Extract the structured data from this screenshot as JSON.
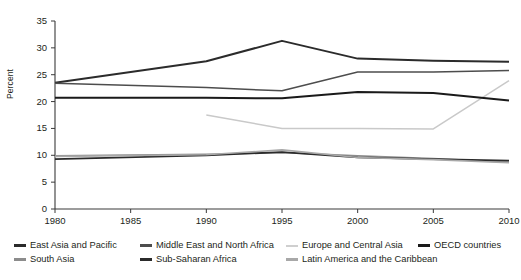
{
  "chart_data": {
    "type": "line",
    "title": "",
    "xlabel": "",
    "ylabel": "Percent",
    "x": [
      1980,
      1985,
      1990,
      1995,
      2000,
      2005,
      2010
    ],
    "xticks": [
      "1980",
      "1985",
      "1990",
      "1995",
      "2000",
      "2005",
      "2010"
    ],
    "yticks": [
      "0",
      "5",
      "10",
      "15",
      "20",
      "25",
      "30",
      "35"
    ],
    "xlim": [
      1980,
      2010
    ],
    "ylim": [
      0,
      35
    ],
    "grid": false,
    "legend_position": "bottom",
    "series": [
      {
        "name": "East Asia and Pacific",
        "color": "#2b2b2b",
        "width": 2.0,
        "x": [
          1980,
          1990,
          1995,
          2000,
          2005,
          2010
        ],
        "values": [
          23.5,
          27.5,
          31.3,
          28.0,
          27.6,
          27.4
        ]
      },
      {
        "name": "Middle East and North Africa",
        "color": "#4d4d4d",
        "width": 1.5,
        "x": [
          1980,
          1990,
          1995,
          2000,
          2005,
          2010
        ],
        "values": [
          23.4,
          22.6,
          22.0,
          25.5,
          25.5,
          25.8
        ]
      },
      {
        "name": "Europe and Central Asia",
        "color": "#c9c9c9",
        "width": 1.5,
        "x": [
          1990,
          1995,
          2000,
          2005,
          2010
        ],
        "values": [
          17.5,
          15.0,
          15.0,
          14.9,
          23.9
        ]
      },
      {
        "name": "OECD countries",
        "color": "#1a1a1a",
        "width": 2.0,
        "x": [
          1980,
          1990,
          1995,
          2000,
          2005,
          2010
        ],
        "values": [
          20.7,
          20.7,
          20.6,
          21.8,
          21.6,
          20.2
        ]
      },
      {
        "name": "South Asia",
        "color": "#8c8c8c",
        "width": 1.5,
        "x": [
          1980,
          1990,
          1995,
          2000,
          2005,
          2010
        ],
        "values": [
          9.9,
          10.2,
          10.5,
          9.9,
          9.4,
          8.7
        ]
      },
      {
        "name": "Sub-Saharan Africa",
        "color": "#2b2b2b",
        "width": 1.8,
        "x": [
          1980,
          1990,
          1995,
          2000,
          2005,
          2010
        ],
        "values": [
          9.3,
          10.0,
          10.6,
          9.6,
          9.3,
          9.0
        ]
      },
      {
        "name": "Latin America and the Caribbean",
        "color": "#a8a8a8",
        "width": 1.6,
        "x": [
          1980,
          1990,
          1995,
          2000,
          2005,
          2010
        ],
        "values": [
          9.8,
          10.1,
          11.0,
          9.6,
          9.2,
          8.6
        ]
      }
    ]
  },
  "axis": {
    "y_label": "Percent",
    "y_ticks": [
      "35",
      "30",
      "25",
      "20",
      "15",
      "10",
      "5",
      "0"
    ],
    "x_ticks": [
      "1980",
      "1985",
      "1990",
      "1995",
      "2000",
      "2005",
      "2010"
    ]
  },
  "legend": {
    "items": [
      {
        "label": "East Asia and Pacific",
        "color": "#2b2b2b",
        "thickness": "3px"
      },
      {
        "label": "Middle East and North Africa",
        "color": "#4d4d4d",
        "thickness": "2.5px"
      },
      {
        "label": "Europe and Central Asia",
        "color": "#cfcfcf",
        "thickness": "2px"
      },
      {
        "label": "OECD countries",
        "color": "#1a1a1a",
        "thickness": "3px"
      },
      {
        "label": "South Asia",
        "color": "#8c8c8c",
        "thickness": "2.5px"
      },
      {
        "label": "Sub-Saharan Africa",
        "color": "#2b2b2b",
        "thickness": "3px"
      },
      {
        "label": "Latin America and the Caribbean",
        "color": "#a8a8a8",
        "thickness": "2.5px"
      }
    ]
  }
}
